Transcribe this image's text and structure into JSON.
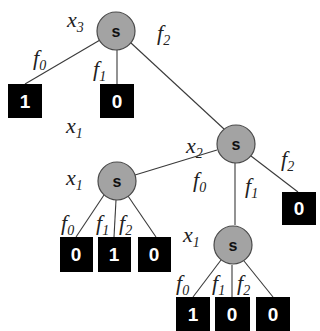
{
  "diagram": {
    "type": "decision-tree",
    "node_symbol": "s",
    "colors": {
      "node_fill": "#a3a3a3",
      "node_stroke": "#4a4a4a",
      "leaf_fill": "#000000",
      "leaf_text": "#ffffff",
      "edge": "#3a3a3a"
    },
    "nodes": [
      {
        "id": "root",
        "symbol": "s",
        "variable": {
          "base": "x",
          "sub": "3"
        }
      },
      {
        "id": "n_x2",
        "symbol": "s",
        "variable": {
          "base": "x",
          "sub": "2"
        }
      },
      {
        "id": "n_x1_left",
        "symbol": "s",
        "variable": {
          "base": "x",
          "sub": "1"
        }
      },
      {
        "id": "n_x1_bottom",
        "symbol": "s",
        "variable": {
          "base": "x",
          "sub": "1"
        }
      }
    ],
    "floating_labels": [
      {
        "base": "x",
        "sub": "1"
      }
    ],
    "leaves": [
      {
        "id": "l_root_f0",
        "value": "1"
      },
      {
        "id": "l_root_f1",
        "value": "0"
      },
      {
        "id": "l_x2_f2",
        "value": "0"
      },
      {
        "id": "l_x1l_f0",
        "value": "0"
      },
      {
        "id": "l_x1l_f1",
        "value": "1"
      },
      {
        "id": "l_x1l_f2",
        "value": "0"
      },
      {
        "id": "l_x1b_f0",
        "value": "1"
      },
      {
        "id": "l_x1b_f1",
        "value": "0"
      },
      {
        "id": "l_x1b_f2",
        "value": "0"
      }
    ],
    "edges": [
      {
        "from": "root",
        "to": "l_root_f0",
        "label": {
          "base": "f",
          "sub": "0"
        }
      },
      {
        "from": "root",
        "to": "l_root_f1",
        "label": {
          "base": "f",
          "sub": "1"
        }
      },
      {
        "from": "root",
        "to": "n_x2",
        "label": {
          "base": "f",
          "sub": "2"
        }
      },
      {
        "from": "n_x2",
        "to": "n_x1_left",
        "label": {
          "base": "f",
          "sub": "0"
        }
      },
      {
        "from": "n_x2",
        "to": "n_x1_bottom",
        "label": {
          "base": "f",
          "sub": "1"
        }
      },
      {
        "from": "n_x2",
        "to": "l_x2_f2",
        "label": {
          "base": "f",
          "sub": "2"
        }
      },
      {
        "from": "n_x1_left",
        "to": "l_x1l_f0",
        "label": {
          "base": "f",
          "sub": "0"
        }
      },
      {
        "from": "n_x1_left",
        "to": "l_x1l_f1",
        "label": {
          "base": "f",
          "sub": "1"
        }
      },
      {
        "from": "n_x1_left",
        "to": "l_x1l_f2",
        "label": {
          "base": "f",
          "sub": "2"
        }
      },
      {
        "from": "n_x1_bottom",
        "to": "l_x1b_f0",
        "label": {
          "base": "f",
          "sub": "0"
        }
      },
      {
        "from": "n_x1_bottom",
        "to": "l_x1b_f1",
        "label": {
          "base": "f",
          "sub": "1"
        }
      },
      {
        "from": "n_x1_bottom",
        "to": "l_x1b_f2",
        "label": {
          "base": "f",
          "sub": "2"
        }
      }
    ]
  }
}
